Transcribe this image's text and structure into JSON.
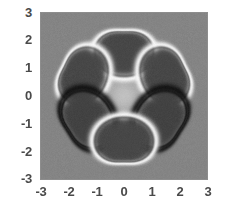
{
  "chart_data": {
    "type": "heatmap",
    "title": "",
    "subtitle": "",
    "xlabel": "",
    "ylabel": "",
    "xlim": [
      -3,
      3
    ],
    "ylim": [
      -3,
      3
    ],
    "grid": false,
    "legend": "none",
    "colormap": "grayscale",
    "xticks": [
      -3,
      -2,
      -1,
      0,
      1,
      2,
      3
    ],
    "yticks": [
      -3,
      -2,
      -1,
      0,
      1,
      2,
      3
    ],
    "xtick_labels": [
      "-3",
      "-2",
      "-1",
      "0",
      "1",
      "2",
      "3"
    ],
    "ytick_labels": [
      "3",
      "2",
      "1",
      "0",
      "-1",
      "-2",
      "-3"
    ],
    "background_value": 0.52,
    "value_range": [
      0.0,
      1.0
    ],
    "lobes": [
      {
        "name": "top",
        "center_x": 0.0,
        "center_y": 1.72,
        "radius": 0.92,
        "fill": 0.28,
        "halo": "bright",
        "halo_value": 0.97,
        "rotation_deg": 0
      },
      {
        "name": "upper-left",
        "center_x": -1.62,
        "center_y": 0.8,
        "radius": 0.92,
        "fill": 0.28,
        "halo": "bright",
        "halo_value": 0.97,
        "rotation_deg": -60
      },
      {
        "name": "upper-right",
        "center_x": 1.62,
        "center_y": 0.8,
        "radius": 0.92,
        "fill": 0.28,
        "halo": "bright",
        "halo_value": 0.97,
        "rotation_deg": 60
      },
      {
        "name": "lower-left",
        "center_x": -1.45,
        "center_y": -0.92,
        "radius": 0.95,
        "fill": 0.26,
        "halo": "dark",
        "halo_value": 0.05,
        "rotation_deg": -120
      },
      {
        "name": "lower-right",
        "center_x": 1.45,
        "center_y": -0.92,
        "radius": 0.95,
        "fill": 0.26,
        "halo": "dark",
        "halo_value": 0.05,
        "rotation_deg": 120
      },
      {
        "name": "bottom",
        "center_x": 0.0,
        "center_y": -1.78,
        "radius": 0.92,
        "fill": 0.28,
        "halo": "bright",
        "halo_value": 0.97,
        "rotation_deg": 180
      }
    ],
    "center_feature": {
      "name": "bright-star",
      "value": 0.8,
      "extent": 0.55
    }
  },
  "axes": {
    "x_labels": [
      "-3",
      "-2",
      "-1",
      "0",
      "1",
      "2",
      "3"
    ],
    "y_labels": [
      "3",
      "2",
      "1",
      "0",
      "-1",
      "-2",
      "-3"
    ]
  },
  "colors": {
    "frame": "#8d8d8d",
    "label": "#4a4a4a",
    "background": "#ffffff",
    "plot_background": "#a0a0a0"
  }
}
